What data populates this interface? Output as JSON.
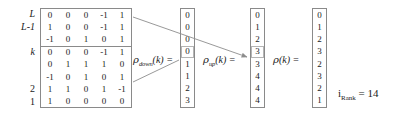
{
  "matrix": {
    "name": "binary-coefficient-matrix",
    "row_labels": [
      "L",
      "L-1",
      "",
      "k",
      "",
      "",
      "2",
      "1"
    ],
    "block_split_after_row": 3,
    "rows": [
      [
        "0",
        "0",
        "0",
        "-1",
        "1"
      ],
      [
        "1",
        "0",
        "0",
        "-1",
        "1"
      ],
      [
        "-1",
        "0",
        "1",
        "0",
        "1"
      ],
      [
        "0",
        "0",
        "0",
        "-1",
        "1"
      ],
      [
        "0",
        "1",
        "1",
        "1",
        "0"
      ],
      [
        "-1",
        "0",
        "1",
        "0",
        "1"
      ],
      [
        "1",
        "1",
        "0",
        "1",
        "-1"
      ],
      [
        "1",
        "0",
        "0",
        "0",
        "0"
      ]
    ]
  },
  "vectors": [
    {
      "id": "rho-down",
      "label_rho": "ρ",
      "label_sub": "down",
      "label_arg": "(k) =",
      "values": [
        "0",
        "0",
        "0",
        "0",
        "1",
        "1",
        "2",
        "3"
      ],
      "highlight_index": 3
    },
    {
      "id": "rho-up",
      "label_rho": "ρ",
      "label_sub": "up",
      "label_arg": "(k) =",
      "values": [
        "0",
        "1",
        "2",
        "3",
        "3",
        "4",
        "4",
        "4"
      ],
      "highlight_index": 3
    },
    {
      "id": "rho",
      "label_rho": "ρ",
      "label_sub": "",
      "label_arg": "(k) =",
      "values": [
        "0",
        "1",
        "2",
        "3",
        "2",
        "3",
        "2",
        "1"
      ],
      "highlight_index": -1
    }
  ],
  "irank": {
    "symbol": "i",
    "subscript": "Rank",
    "equals": "=",
    "value": "14"
  },
  "colors": {
    "border": "#8a8a8a",
    "text": "#1a1a1a",
    "highlight_border": "#b5b5b5",
    "arrow": "#8d8d8d",
    "background": "#ffffff"
  }
}
